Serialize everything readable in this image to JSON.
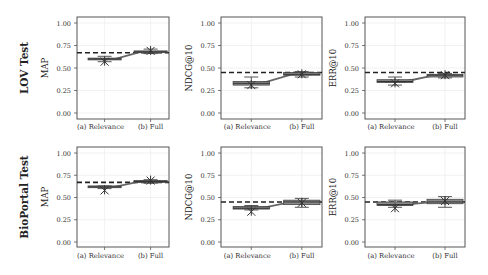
{
  "figure": {
    "row_labels": [
      "LOV Test",
      "BioPortal Test"
    ],
    "x_categories": [
      "(a) Relevance",
      "(b) Full"
    ],
    "y_ticks": [
      "0.00",
      "0.25",
      "0.50",
      "0.75",
      "1.00"
    ],
    "colors": {
      "box_fill": "#8a8a8a",
      "box_edge": "#444444",
      "line": "#666666",
      "dashed": "#222222",
      "frame": "#555555",
      "grid": "#eeeeee",
      "text": "#333333"
    }
  },
  "chart_data": [
    {
      "type": "box",
      "row": "LOV Test",
      "ylabel": "MAP",
      "categories": [
        "(a) Relevance",
        "(b) Full"
      ],
      "ylim": [
        0,
        1
      ],
      "median_line": [
        0.6,
        0.68
      ],
      "boxes": [
        {
          "q1": 0.59,
          "median": 0.6,
          "q3": 0.61,
          "whisker_low": 0.57,
          "whisker_high": 0.63,
          "outlier": 0.57
        },
        {
          "q1": 0.67,
          "median": 0.68,
          "q3": 0.69,
          "whisker_low": 0.66,
          "whisker_high": 0.71,
          "outlier": 0.69
        }
      ],
      "baseline_dashed": 0.67
    },
    {
      "type": "box",
      "row": "LOV Test",
      "ylabel": "NDCG@10",
      "categories": [
        "(a) Relevance",
        "(b) Full"
      ],
      "ylim": [
        0,
        1
      ],
      "median_line": [
        0.33,
        0.43
      ],
      "boxes": [
        {
          "q1": 0.31,
          "median": 0.33,
          "q3": 0.35,
          "whisker_low": 0.28,
          "whisker_high": 0.4,
          "outlier": 0.31
        },
        {
          "q1": 0.42,
          "median": 0.43,
          "q3": 0.45,
          "whisker_low": 0.4,
          "whisker_high": 0.46,
          "outlier": 0.43
        }
      ],
      "baseline_dashed": 0.45
    },
    {
      "type": "box",
      "row": "LOV Test",
      "ylabel": "ERR@10",
      "categories": [
        "(a) Relevance",
        "(b) Full"
      ],
      "ylim": [
        0,
        1
      ],
      "median_line": [
        0.35,
        0.42
      ],
      "boxes": [
        {
          "q1": 0.34,
          "median": 0.35,
          "q3": 0.37,
          "whisker_low": 0.31,
          "whisker_high": 0.4,
          "outlier": 0.33
        },
        {
          "q1": 0.4,
          "median": 0.42,
          "q3": 0.43,
          "whisker_low": 0.39,
          "whisker_high": 0.44,
          "outlier": 0.42
        }
      ],
      "baseline_dashed": 0.45
    },
    {
      "type": "box",
      "row": "BioPortal Test",
      "ylabel": "MAP",
      "categories": [
        "(a) Relevance",
        "(b) Full"
      ],
      "ylim": [
        0,
        1
      ],
      "median_line": [
        0.62,
        0.68
      ],
      "boxes": [
        {
          "q1": 0.61,
          "median": 0.62,
          "q3": 0.63,
          "whisker_low": 0.6,
          "whisker_high": 0.63,
          "outlier": 0.58
        },
        {
          "q1": 0.67,
          "median": 0.68,
          "q3": 0.69,
          "whisker_low": 0.66,
          "whisker_high": 0.7,
          "outlier": 0.69
        }
      ],
      "baseline_dashed": 0.67
    },
    {
      "type": "box",
      "row": "BioPortal Test",
      "ylabel": "NDCG@10",
      "categories": [
        "(a) Relevance",
        "(b) Full"
      ],
      "ylim": [
        0,
        1
      ],
      "median_line": [
        0.38,
        0.45
      ],
      "boxes": [
        {
          "q1": 0.37,
          "median": 0.38,
          "q3": 0.4,
          "whisker_low": 0.36,
          "whisker_high": 0.41,
          "outlier": 0.34
        },
        {
          "q1": 0.42,
          "median": 0.45,
          "q3": 0.47,
          "whisker_low": 0.39,
          "whisker_high": 0.49,
          "outlier": 0.44
        }
      ],
      "baseline_dashed": 0.45
    },
    {
      "type": "box",
      "row": "BioPortal Test",
      "ylabel": "ERR@10",
      "categories": [
        "(a) Relevance",
        "(b) Full"
      ],
      "ylim": [
        0,
        1
      ],
      "median_line": [
        0.42,
        0.45
      ],
      "boxes": [
        {
          "q1": 0.41,
          "median": 0.42,
          "q3": 0.45,
          "whisker_low": 0.39,
          "whisker_high": 0.47,
          "outlier": 0.38
        },
        {
          "q1": 0.43,
          "median": 0.45,
          "q3": 0.48,
          "whisker_low": 0.39,
          "whisker_high": 0.51,
          "outlier": 0.46
        }
      ],
      "baseline_dashed": 0.45
    }
  ]
}
